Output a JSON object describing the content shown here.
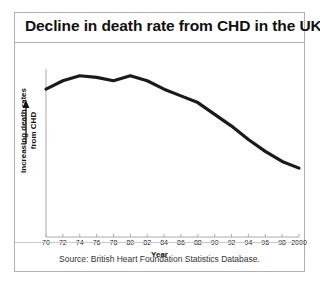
{
  "figure": {
    "title": "Decline in death rate from CHD in the UK",
    "source_caption": "Source: British Heart Foundation Statistics Database.",
    "border_color": "#b0b0b0"
  },
  "chart_data": {
    "type": "line",
    "title": "Decline in death rate from CHD in the UK",
    "xlabel": "Year",
    "ylabel": "Increasing death rates from CHD",
    "ylabel_line1": "Increasing death rates",
    "ylabel_line2": "from CHD",
    "y_axis_arrow": "up-arrow",
    "grid": false,
    "legend": "none",
    "line_color": "#1a1a1a",
    "axis_color": "#aaaaaa",
    "x_tick_labels": [
      "70",
      "72",
      "74",
      "76",
      "78",
      "80",
      "82",
      "84",
      "86",
      "88",
      "90",
      "92",
      "94",
      "96",
      "98",
      "2000"
    ],
    "x": [
      1970,
      1972,
      1974,
      1976,
      1978,
      1980,
      1982,
      1984,
      1986,
      1988,
      1990,
      1992,
      1994,
      1996,
      1998,
      2000
    ],
    "xlim": [
      1970,
      2000
    ],
    "ylim": [
      0,
      100
    ],
    "y_axis_ticks_shown": false,
    "series": [
      {
        "name": "Death rate from CHD",
        "values": [
          88,
          93,
          96,
          95,
          93,
          96,
          93,
          88,
          84,
          80,
          73,
          66,
          58,
          51,
          45,
          41
        ]
      }
    ],
    "annotations": [
      "Death rates rise slightly to a peak in the mid-to-late 1970s, then decline steadily through 2000."
    ]
  }
}
